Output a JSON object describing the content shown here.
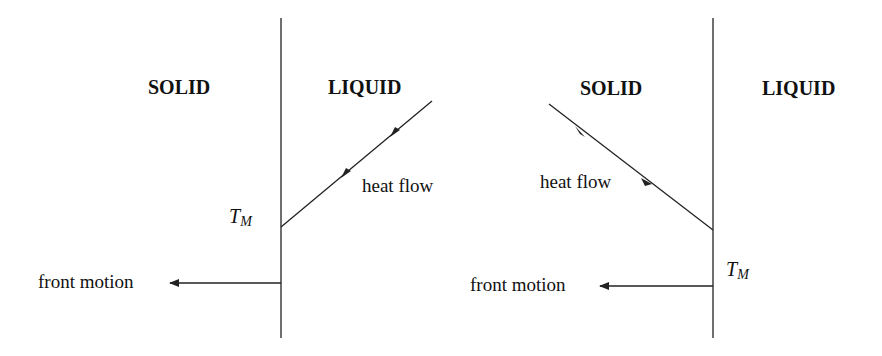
{
  "diagram": {
    "left_panel": {
      "solid_label": "SOLID",
      "liquid_label": "LIQUID",
      "heat_flow_label": "heat flow",
      "tm_label_main": "T",
      "tm_label_sub": "M",
      "front_motion_label": "front motion"
    },
    "right_panel": {
      "solid_label": "SOLID",
      "liquid_label": "LIQUID",
      "heat_flow_label": "heat flow",
      "tm_label_main": "T",
      "tm_label_sub": "M",
      "front_motion_label": "front motion"
    },
    "colors": {
      "line": "#222222",
      "text": "#111111",
      "background": "#ffffff"
    }
  }
}
